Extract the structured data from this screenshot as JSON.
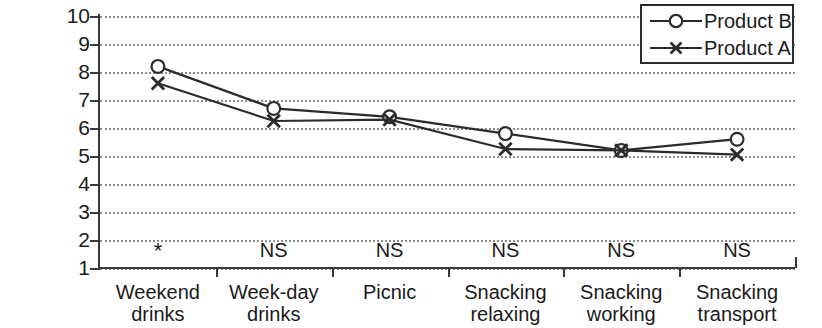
{
  "chart_data": {
    "type": "line",
    "title": "",
    "xlabel": "",
    "ylabel": "",
    "ylim": [
      1,
      10
    ],
    "ytick_labels": [
      "10",
      "9",
      "8",
      "7",
      "6",
      "5",
      "4",
      "3",
      "2",
      "1"
    ],
    "grid": true,
    "legend_position": "top-right",
    "categories": [
      "Weekend drinks",
      "Week-day drinks",
      "Picnic",
      "Snacking relaxing",
      "Snacking working",
      "Snacking transport"
    ],
    "category_lines": [
      [
        "Weekend",
        "drinks"
      ],
      [
        "Week-day",
        "drinks"
      ],
      [
        "Picnic",
        ""
      ],
      [
        "Snacking",
        "relaxing"
      ],
      [
        "Snacking",
        "working"
      ],
      [
        "Snacking",
        "transport"
      ]
    ],
    "significance": [
      "*",
      "NS",
      "NS",
      "NS",
      "NS",
      "NS"
    ],
    "series": [
      {
        "name": "Product B",
        "marker": "circle",
        "values": [
          8.2,
          6.7,
          6.4,
          5.8,
          5.2,
          5.6
        ]
      },
      {
        "name": "Product A",
        "marker": "x",
        "values": [
          7.6,
          6.25,
          6.3,
          5.25,
          5.2,
          5.05
        ]
      }
    ]
  },
  "legend": {
    "items": [
      {
        "label": "Product B",
        "marker": "circle"
      },
      {
        "label": "Product A",
        "marker": "x"
      }
    ]
  },
  "colors": {
    "line": "#2b2b2b",
    "grid": "#8d8d8d",
    "axis": "#3a3a3a",
    "text": "#1a1a1a",
    "background": "#ffffff"
  }
}
